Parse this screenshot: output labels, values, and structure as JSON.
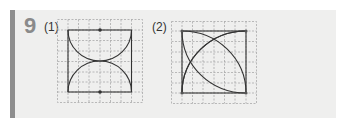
{
  "problem": {
    "number": "9",
    "parts": [
      {
        "label": "(1)"
      },
      {
        "label": "(2)"
      }
    ]
  },
  "colors": {
    "panel": "#efefee",
    "bar": "#8e8e8e",
    "number": "#8a8a8a",
    "grid": "#9a9a9a",
    "stroke": "#333333"
  }
}
